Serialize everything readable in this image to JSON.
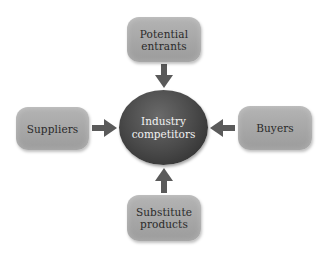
{
  "diagram": {
    "center": {
      "line1": "Industry",
      "line2": "competitors"
    },
    "top": {
      "line1": "Potential",
      "line2": "entrants"
    },
    "left": {
      "line1": "Suppliers"
    },
    "right": {
      "line1": "Buyers"
    },
    "bottom": {
      "line1": "Substitute",
      "line2": "products"
    },
    "colors": {
      "box_fill": "#a8a8a8",
      "center_fill": "#3c3c3c",
      "arrow": "#5a5a5a",
      "box_text": "#2a2a2a",
      "center_text": "#f2f2f2"
    }
  }
}
